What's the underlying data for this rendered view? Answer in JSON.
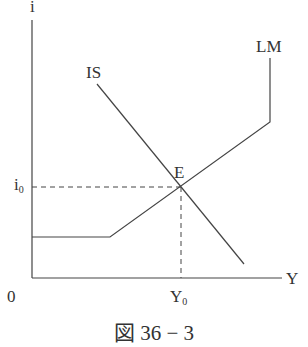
{
  "diagram": {
    "axes": {
      "y_label": "i",
      "x_label": "Y",
      "origin_label": "0"
    },
    "curves": [
      {
        "name": "IS",
        "label": "IS"
      },
      {
        "name": "LM",
        "label": "LM"
      }
    ],
    "equilibrium": {
      "label": "E",
      "i_label": "i",
      "i_sub": "0",
      "y_label": "Y",
      "y_sub": "0"
    },
    "caption": "図 36 − 3",
    "line_color": "#444444"
  }
}
